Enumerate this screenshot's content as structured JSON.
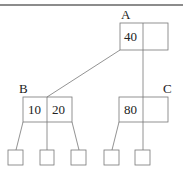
{
  "diagram": {
    "type": "b-tree",
    "nodes": [
      {
        "id": "A",
        "label": "A",
        "keys": [
          "40",
          ""
        ]
      },
      {
        "id": "B",
        "label": "B",
        "keys": [
          "10",
          "20"
        ]
      },
      {
        "id": "C",
        "label": "C",
        "keys": [
          "80",
          ""
        ]
      }
    ],
    "edges": [
      {
        "from": "A",
        "to": "B"
      },
      {
        "from": "A",
        "to": "C"
      }
    ],
    "leaves": [
      {
        "parent": "B"
      },
      {
        "parent": "B"
      },
      {
        "parent": "B"
      },
      {
        "parent": "C"
      },
      {
        "parent": "C"
      }
    ],
    "colors": {
      "stroke": "#777777",
      "text": "#222222"
    }
  }
}
